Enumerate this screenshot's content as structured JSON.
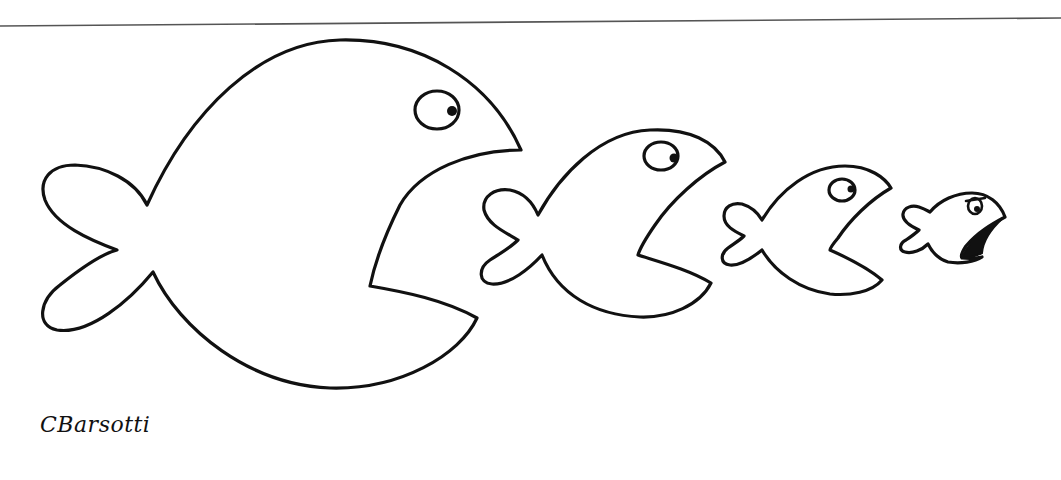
{
  "cartoon": {
    "description": "Four fish in a row, each larger fish about to eat the next smaller one",
    "fish_count": 4,
    "signature": "CBarsotti"
  },
  "colors": {
    "ink": "#111111",
    "paper": "#ffffff",
    "rule": "#555555"
  }
}
